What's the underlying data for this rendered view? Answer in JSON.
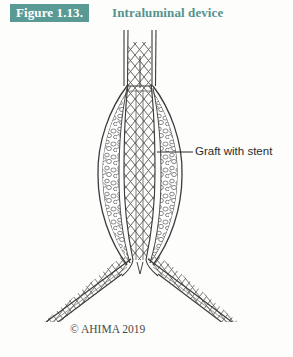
{
  "figure": {
    "number_label": "Figure 1.13.",
    "title": "Intraluminal device",
    "badge_color": "#5a9a94",
    "title_color": "#55938d",
    "background_color": "#fdfdfc"
  },
  "annotations": {
    "graft_with_stent": {
      "label": "Graft with stent",
      "leader_line": "leader-line-icon"
    }
  },
  "illustration": {
    "name": "intraluminal-device-diagram",
    "description": "Endovascular stent graft inside an abdominal aortic aneurysm with bifurcated iliac limbs",
    "ink_color": "#3b3b3b",
    "parts": [
      {
        "name": "proximal-aorta",
        "label": "proximal aorta"
      },
      {
        "name": "aneurysm-sac",
        "label": "aneurysm sac"
      },
      {
        "name": "thrombus-fill",
        "label": "thrombus"
      },
      {
        "name": "stent-mesh",
        "label": "stent mesh"
      },
      {
        "name": "bifurcation",
        "label": "bifurcation"
      },
      {
        "name": "iliac-limb-left",
        "label": "left iliac limb"
      },
      {
        "name": "iliac-limb-right",
        "label": "right iliac limb"
      },
      {
        "name": "flow-arrow-left",
        "label": "blood flow arrow left"
      },
      {
        "name": "flow-arrow-right",
        "label": "blood flow arrow right"
      }
    ]
  },
  "footer": {
    "copyright": "© AHIMA 2019"
  }
}
